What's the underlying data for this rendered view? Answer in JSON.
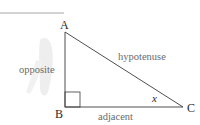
{
  "diagram": {
    "type": "right-triangle",
    "vertices": {
      "A": {
        "label": "A"
      },
      "B": {
        "label": "B"
      },
      "C": {
        "label": "C"
      }
    },
    "sides": {
      "opposite": {
        "label": "opposite"
      },
      "hypotenuse": {
        "label": "hypotenuse"
      },
      "adjacent": {
        "label": "adjacent"
      }
    },
    "angle": {
      "label": "x"
    },
    "right_angle_at": "B",
    "colors": {
      "line": "#3a3a3a",
      "top_rule": "#a0a0a0",
      "text": "#6a6a6a"
    }
  }
}
